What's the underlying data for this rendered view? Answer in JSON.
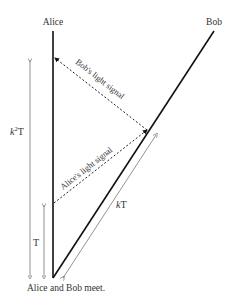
{
  "diagram": {
    "worldlines": {
      "alice": {
        "label": "Alice"
      },
      "bob": {
        "label": "Bob"
      }
    },
    "signals": {
      "bob_signal": {
        "label": "Bob's light signal"
      },
      "alice_signal": {
        "label": "Alice's light signal"
      }
    },
    "intervals": {
      "k2T": {
        "label_base": "k",
        "label_sup": "2",
        "label_tail": "T"
      },
      "T": {
        "label": "T"
      },
      "kT": {
        "label_italic": "k",
        "label_tail": "T"
      }
    },
    "event": {
      "label": "Alice and Bob meet."
    },
    "colors": {
      "worldline": "#111111",
      "signal": "#222222",
      "interval": "#777777",
      "text": "#333333"
    }
  }
}
